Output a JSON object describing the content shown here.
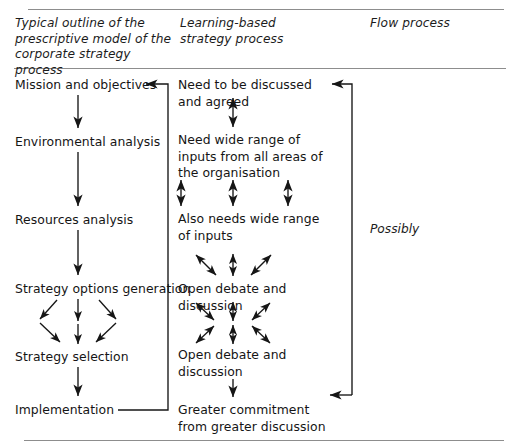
{
  "figure": {
    "type": "flow-diagram",
    "columns": [
      {
        "id": "left",
        "heading": "Typical outline of the prescriptive model of the corporate strategy process"
      },
      {
        "id": "middle",
        "heading": "Learning-based strategy process"
      },
      {
        "id": "right",
        "heading": "Flow process"
      }
    ],
    "left_column": {
      "nodes": [
        "Mission and objectives",
        "Environmental analysis",
        "Resources analysis",
        "Strategy options generation",
        "Strategy selection",
        "Implementation"
      ]
    },
    "middle_column": {
      "nodes": [
        "Need to be discussed and agreed",
        "Need wide range of inputs from all areas of the organisation",
        "Also needs wide range of inputs",
        "Open debate and discussion",
        "Open debate and discussion",
        "Greater commitment from greater discussion"
      ]
    },
    "right_column": {
      "label": "Possibly"
    },
    "colors": {
      "rule": "#8d8d8d",
      "ink": "#151515",
      "background": "#ffffff"
    }
  }
}
